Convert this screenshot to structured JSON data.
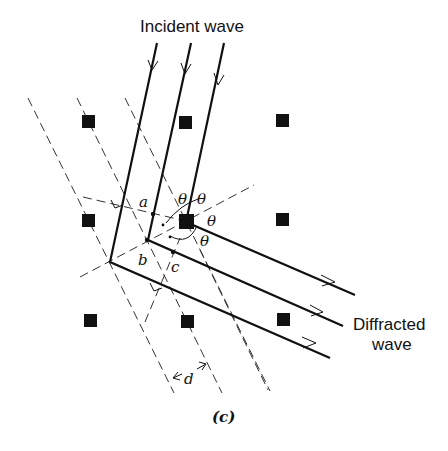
{
  "figure": {
    "caption": "(c)",
    "labels": {
      "incident": "Incident wave",
      "diffracted_line1": "Diffracted",
      "diffracted_line2": "wave",
      "point_a": "a",
      "point_b": "b",
      "point_c": "c",
      "spacing": "d",
      "theta": "θ"
    },
    "lattice_points": [
      [
        89,
        122
      ],
      [
        185,
        122
      ],
      [
        282,
        121
      ],
      [
        89,
        221
      ],
      [
        186,
        221
      ],
      [
        282,
        220
      ],
      [
        91,
        321
      ],
      [
        187,
        321
      ],
      [
        283,
        320
      ]
    ]
  }
}
